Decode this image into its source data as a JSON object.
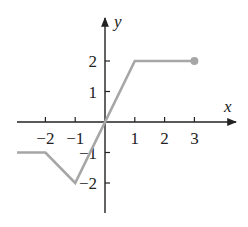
{
  "chart_data": {
    "type": "line",
    "title": "",
    "xlabel": "x",
    "ylabel": "y",
    "xlim": [
      -3,
      4
    ],
    "ylim": [
      -3,
      3
    ],
    "grid": false,
    "x_ticks": [
      -2,
      -1,
      1,
      2,
      3
    ],
    "y_ticks": [
      -2,
      -1,
      1,
      2
    ],
    "x_tick_labels": [
      "−2",
      "−1",
      "1",
      "2",
      "3"
    ],
    "y_tick_labels": [
      "−2",
      "−1",
      "1",
      "2"
    ],
    "series": [
      {
        "name": "f(x)",
        "color": "#a6a6a6",
        "points": [
          [
            -3,
            -1
          ],
          [
            -2,
            -1
          ],
          [
            -1,
            -2
          ],
          [
            1,
            2
          ],
          [
            3,
            2
          ]
        ],
        "left_end": "continues",
        "right_end": "closed-dot"
      }
    ]
  },
  "colors": {
    "axis": "#222222",
    "curve": "#a6a6a6"
  }
}
